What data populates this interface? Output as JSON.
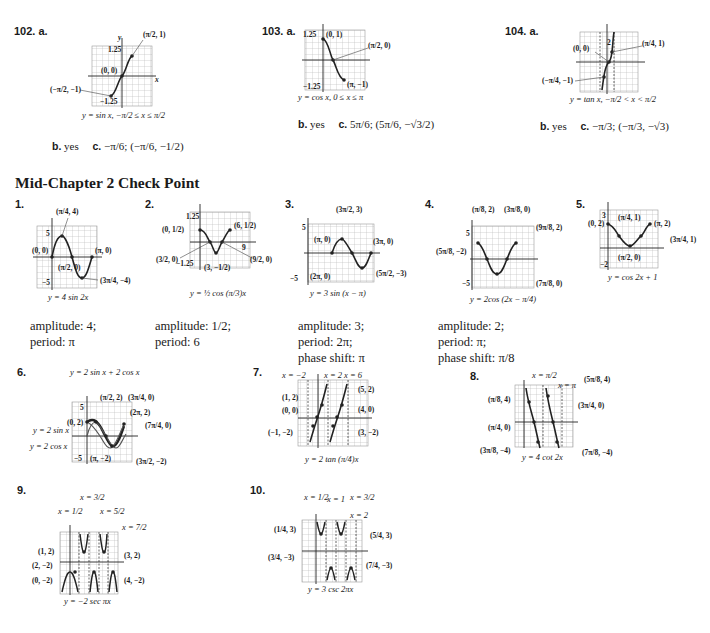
{
  "problems_top": [
    {
      "number": "102.",
      "part_a": "a.",
      "caption": "y = sin x, −π/2 ≤ x ≤ π/2",
      "points": [
        "(π/2, 1)",
        "(0, 0)",
        "(−π/2, −1)"
      ],
      "axis_labels": {
        "ymax": "1.25",
        "ymin": "−1.25",
        "x": "x",
        "y": "y",
        "xticks": [
          "−π",
          "−π/2",
          "π/2",
          "π"
        ]
      },
      "part_b": "b.",
      "b_answer": "yes",
      "part_c": "c.",
      "c_answer": "−π/6; (−π/6, −1/2)"
    },
    {
      "number": "103.",
      "part_a": "a.",
      "caption": "y = cos x, 0 ≤ x ≤ π",
      "points": [
        "(0, 1)",
        "(π/2, 0)",
        "(π, −1)"
      ],
      "axis_labels": {
        "ymax": "1.25",
        "ymin": "−1.25",
        "x": "x",
        "y": "y",
        "xticks": [
          "−π/2",
          "π/2",
          "π",
          "3π/2"
        ]
      },
      "part_b": "b.",
      "b_answer": "yes",
      "part_c": "c.",
      "c_answer": "5π/6; (5π/6, −√3/2)"
    },
    {
      "number": "104.",
      "part_a": "a.",
      "caption": "y = tan x, −π/2 < x < π/2",
      "points": [
        "(π/4, 1)",
        "(0, 0)",
        "(−π/4, −1)"
      ],
      "axis_labels": {
        "ymax": "2",
        "ymin": "−2",
        "x": "x",
        "y": "y",
        "xticks": [
          "−π",
          "−π/2",
          "π/2",
          "π"
        ]
      },
      "part_b": "b.",
      "b_answer": "yes",
      "part_c": "c.",
      "c_answer": "−π/3; (−π/3, −√3)"
    }
  ],
  "section_title": "Mid-Chapter 2 Check Point",
  "check_point": [
    {
      "number": "1.",
      "caption": "y = 4 sin 2x",
      "points": [
        "(π/4, 4)",
        "(0, 0)",
        "(π, 0)",
        "(π/2, 0)",
        "(3π/4, −4)"
      ],
      "ymax": "5",
      "ymin": "−5",
      "xtick": "π",
      "notes": [
        "amplitude: 4;",
        "period: π"
      ]
    },
    {
      "number": "2.",
      "caption": "y = ½ cos (π/3)x",
      "points": [
        "(0, 1/2)",
        "(6, 1/2)",
        "(3/2, 0)",
        "(3, −1/2)",
        "(9/2, 0)"
      ],
      "ymax": "1.25",
      "ymin": "−1.25",
      "xtick": "9",
      "notes": [
        "amplitude: 1/2;",
        "period: 6"
      ]
    },
    {
      "number": "3.",
      "caption": "y = 3 sin (x − π)",
      "points": [
        "(3π/2, 3)",
        "(π, 0)",
        "(3π, 0)",
        "(2π, 0)",
        "(5π/2, −3)"
      ],
      "ymax": "5",
      "ymin": "−5",
      "xticks": [
        "π",
        "2π"
      ],
      "notes": [
        "amplitude: 3;",
        "period: 2π;",
        "phase shift: π"
      ]
    },
    {
      "number": "4.",
      "caption": "y = 2cos (2x − π/4)",
      "points": [
        "(π/8, 2)",
        "(3π/8, 0)",
        "(9π/8, 2)",
        "(5π/8, −2)",
        "(7π/8, 0)"
      ],
      "ymax": "5",
      "ymin": "−5",
      "xticks": [
        "π/8",
        "9π/8"
      ],
      "notes": [
        "amplitude: 2;",
        "period: π;",
        "phase shift: π/8"
      ]
    },
    {
      "number": "5.",
      "caption": "y = cos 2x + 1",
      "points": [
        "(0, 2)",
        "(π/4, 1)",
        "(π, 2)",
        "(3π/4, 1)",
        "(π/2, 0)"
      ],
      "ymax": "3",
      "ymin": "−2",
      "xtick": "π"
    },
    {
      "number": "6.",
      "caption": "",
      "curves": [
        "y = 2 sin x + 2 cos x",
        "y = 2 sin x",
        "y = 2 cos x"
      ],
      "points": [
        "(π/2, 2)",
        "(3π/4, 0)",
        "(0, 2)",
        "(2π, 2)",
        "(7π/4, 0)",
        "(π, −2)",
        "(3π/2, −2)"
      ],
      "ymax": "5",
      "ymin": "−5",
      "xtick": "2π"
    },
    {
      "number": "7.",
      "caption": "y = 2 tan (π/4)x",
      "asymptotes": [
        "x = −2",
        "x = 2",
        "x = 6"
      ],
      "points": [
        "(1, 2)",
        "(5, 2)",
        "(0, 0)",
        "(4, 0)",
        "(−1, −2)",
        "(3, −2)"
      ],
      "ymax": "5",
      "ymin": "−5",
      "xtick": "7"
    },
    {
      "number": "8.",
      "caption": "y = 4 cot 2x",
      "asymptotes": [
        "x = π/2",
        "x = π"
      ],
      "points": [
        "(5π/8, 4)",
        "(π/8, 4)",
        "(3π/4, 0)",
        "(π/4, 0)",
        "(3π/8, −4)",
        "(7π/8, −4)"
      ],
      "ymax": "5",
      "xtick": "π"
    },
    {
      "number": "9.",
      "caption": "y = −2 sec πx",
      "asymptotes": [
        "x = 1/2",
        "x = 3/2",
        "x = 5/2",
        "x = 7/2"
      ],
      "points": [
        "(1, 2)",
        "(3, 2)",
        "(2, −2)",
        "(0, −2)",
        "(4, −2)"
      ],
      "ymax": "5",
      "ymin": "−5",
      "xtick": "4"
    },
    {
      "number": "10.",
      "caption": "y = 3 csc 2πx",
      "asymptotes": [
        "x = 1/2",
        "x = 1",
        "x = 3/2",
        "x = 2"
      ],
      "points": [
        "(1/4, 3)",
        "(5/4, 3)",
        "(3/4, −3)",
        "(7/4, −3)"
      ],
      "ymax": "5",
      "ymin": "−5",
      "xtick": "2"
    }
  ]
}
